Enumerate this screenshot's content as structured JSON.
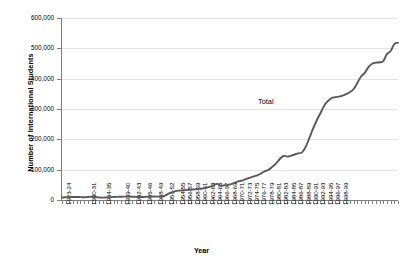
{
  "chart_data": {
    "type": "line",
    "title": "",
    "xlabel": "Year",
    "ylabel": "Number of International Students",
    "ylim": [
      0,
      600000
    ],
    "ytick_labels": [
      "0",
      "100,000",
      "200,000",
      "300,000",
      "400,000",
      "500,000",
      "600,000"
    ],
    "ytick_values": [
      0,
      100000,
      200000,
      300000,
      400000,
      500000,
      600000
    ],
    "grid": true,
    "legend_position": "inline-annotation",
    "annotations": [
      {
        "text": "Total",
        "x_index": 42,
        "y_value": 330000
      }
    ],
    "series": [
      {
        "name": "Total",
        "color": "#595959",
        "values": [
          8000,
          9000,
          9600,
          9800,
          10000,
          9500,
          9000,
          9900,
          10500,
          9800,
          8500,
          7800,
          8400,
          9200,
          9800,
          10300,
          10800,
          11200,
          11500,
          10900,
          10200,
          9800,
          10100,
          10500,
          10900,
          11300,
          11000,
          10600,
          15000,
          22000,
          26000,
          30000,
          31000,
          32000,
          33500,
          34200,
          35000,
          36500,
          38000,
          40000,
          43500,
          48000,
          53000,
          47000,
          48500,
          50000,
          53000,
          58000,
          62000,
          65000,
          70000,
          74000,
          78000,
          82000,
          88000,
          95000,
          100000,
          110000,
          121000,
          135000,
          145000,
          143000,
          146000,
          150000,
          154000,
          157000,
          175000,
          205000,
          235000,
          263000,
          286000,
          311000,
          326000,
          336000,
          339000,
          341000,
          344000,
          349000,
          356000,
          366000,
          386000,
          407000,
          419000,
          438000,
          449000,
          453000,
          454000,
          458000,
          481000,
          491000,
          514000,
          518000
        ]
      }
    ],
    "categories": [
      "1923-24",
      "1924-25",
      "1925-26",
      "1926-27",
      "1927-28",
      "1928-29",
      "1929-30",
      "1930-31",
      "1931-32",
      "1932-33",
      "1933-34",
      "1934-35",
      "1935-36",
      "1936-37",
      "1937-38",
      "1938-39",
      "1939-40",
      "1940-41",
      "1941-42",
      "1942-43",
      "1943-44",
      "1944-45",
      "1945-46",
      "1946-47",
      "1947-48",
      "1948-49",
      "1949-50",
      "1950-51",
      "1951-52",
      "1952-53",
      "1953-54",
      "1954-55",
      "1955-56",
      "1956-57",
      "1957-58",
      "1958-59",
      "1959-60",
      "1960-61",
      "1961-62",
      "1962-63",
      "1963-64",
      "1964-65",
      "1965-66",
      "1966-97",
      "1967-68",
      "1968-69",
      "1969-70",
      "1970-71",
      "1971-72",
      "1972-73",
      "1973-74",
      "1974-75",
      "1975-76",
      "1976-77",
      "1977-78",
      "1978-79",
      "1979-80",
      "1980-81",
      "1981-82",
      "1982-83",
      "1983-84",
      "1984-85",
      "1985-86",
      "1986-87",
      "1987-88",
      "1988-89",
      "1989-90",
      "1990-91",
      "1991-92",
      "1992-93",
      "1993-94",
      "1994-95",
      "1995-96",
      "1996-97",
      "1997-98",
      "1998-99",
      "1999-00",
      "2000-01",
      "2001-02",
      "2002-03",
      "2003-04",
      "2004-05",
      "2005-06",
      "2006-07",
      "2007-08",
      "2008-09",
      "2009-10",
      "2010-11",
      "2011-12",
      "2012-13",
      "2013-14",
      "2014-15"
    ],
    "xtick_labels": [
      "1923-24",
      "1930-31",
      "1934-35",
      "1939-40",
      "1942-43",
      "1945-46",
      "1948-49",
      "1951-52",
      "1954-55",
      "1956-57",
      "1958-59",
      "1960-61",
      "1962-63",
      "1964-65",
      "1966-97",
      "1968-69",
      "1970-71",
      "1972-73",
      "1974-75",
      "1976-77",
      "1978-79",
      "1980-81",
      "1982-83",
      "1984-85",
      "1986-87",
      "1988-89",
      "1990-91",
      "1992-93",
      "1994-95",
      "1996-97",
      "1998-99"
    ],
    "xtick_indices": [
      0,
      7,
      11,
      16,
      19,
      22,
      25,
      28,
      31,
      33,
      35,
      37,
      39,
      41,
      43,
      45,
      47,
      49,
      51,
      53,
      55,
      57,
      59,
      61,
      63,
      65,
      67,
      69,
      71,
      73,
      75
    ]
  },
  "colors": {
    "line": "#595959",
    "grid": "#e3e3e3",
    "axis": "#7f7f7f",
    "text": "#000000",
    "background": "#ffffff"
  }
}
